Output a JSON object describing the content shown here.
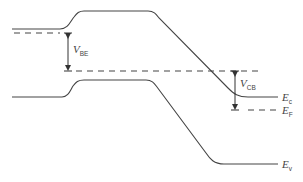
{
  "diagram": {
    "regions": [
      "emitter",
      "base",
      "collector"
    ],
    "bands": {
      "conduction": {
        "name": "E",
        "sub": "c"
      },
      "fermi": {
        "name": "E",
        "sub": "F"
      },
      "valence": {
        "name": "E",
        "sub": "v"
      }
    },
    "voltages": {
      "base_emitter": {
        "name": "V",
        "sub": "BE"
      },
      "collector_base": {
        "name": "V",
        "sub": "CB"
      }
    },
    "colors": {
      "line": "#444444",
      "background": "#ffffff"
    }
  }
}
